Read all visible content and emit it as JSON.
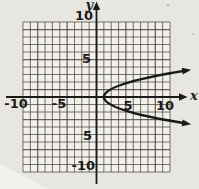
{
  "figure": {
    "y_axis_label": "y",
    "x_axis_label": "x",
    "x_ticks": [
      "-10",
      "-5",
      "5",
      "10"
    ],
    "y_ticks": [
      "10",
      "5",
      "5",
      "-10"
    ],
    "chart_data": {
      "type": "line",
      "title": "",
      "xlabel": "x",
      "ylabel": "y",
      "xlim": [
        -10,
        10
      ],
      "ylim": [
        -10,
        10
      ],
      "grid": true,
      "grid_step": 1,
      "tick_step": 5,
      "legend": "none",
      "series": [
        {
          "name": "rightward-opening parabola",
          "style": "thick solid curve with arrowheads on both ends",
          "vertex": [
            1,
            0
          ],
          "approx_equation": "x = y^2 + 1",
          "points": [
            [
              12,
              3.5
            ],
            [
              10,
              3
            ],
            [
              5,
              2
            ],
            [
              2,
              1
            ],
            [
              1,
              0
            ],
            [
              2,
              -1
            ],
            [
              5,
              -2
            ],
            [
              10,
              -3
            ],
            [
              12,
              -3.5
            ]
          ]
        }
      ]
    },
    "colors": {
      "ink": "#1a1a18",
      "grid_line": "#45403a",
      "paper": "#e8e6e1",
      "grid_paper": "#f2f0ea"
    }
  }
}
